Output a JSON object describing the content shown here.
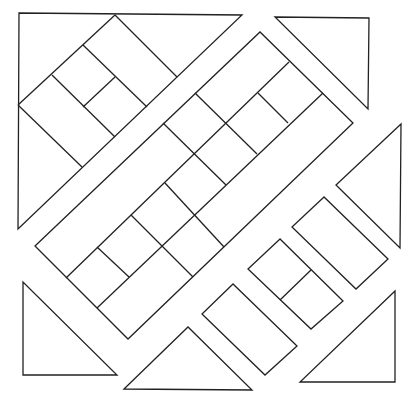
{
  "diagram": {
    "title": "Quilt block line drawing",
    "stroke_color": "#222222",
    "background_color": "#ffffff",
    "pieces": [
      {
        "name": "top-left-triangle",
        "points": "19,13 242,15 18,229"
      },
      {
        "name": "top-right-triangle",
        "points": "275,17 369,18 368,109"
      },
      {
        "name": "right-triangle",
        "points": "401,124 336,185 400,248"
      },
      {
        "name": "bottom-right-triangle",
        "points": "395,291 300,382 395,382"
      },
      {
        "name": "bottom-center-triangle",
        "points": "124,389 188,327 252,390"
      },
      {
        "name": "bottom-left-triangle",
        "points": "23,282 23,375 117,375"
      },
      {
        "name": "center-band",
        "points": "35,246 260,32 353,123 128,339"
      },
      {
        "name": "right-rectangle",
        "points": "324,197 292,227 356,289 388,259"
      },
      {
        "name": "middle-rectangle",
        "points": "280,239 248,269 311,329 343,301"
      },
      {
        "name": "lower-rectangle",
        "points": "233,284 202,314 265,375 297,346"
      }
    ],
    "segments": [
      {
        "name": "tl-rect-edge-1",
        "x1": 115,
        "y1": 15,
        "x2": 177,
        "y2": 77
      },
      {
        "name": "tl-rect-edge-2",
        "x1": 115,
        "y1": 15,
        "x2": 18,
        "y2": 105
      },
      {
        "name": "tl-rect-edge-3",
        "x1": 83,
        "y1": 45,
        "x2": 147,
        "y2": 107
      },
      {
        "name": "tl-rect-edge-4",
        "x1": 52,
        "y1": 75,
        "x2": 115,
        "y2": 137
      },
      {
        "name": "tl-rect-edge-5",
        "x1": 18,
        "y1": 105,
        "x2": 82,
        "y2": 167
      },
      {
        "name": "tl-rect-divider",
        "x1": 115,
        "y1": 77,
        "x2": 83,
        "y2": 107
      },
      {
        "name": "band-long-line-b",
        "x1": 66,
        "y1": 278,
        "x2": 289,
        "y2": 62
      },
      {
        "name": "band-long-line-c",
        "x1": 97,
        "y1": 308,
        "x2": 323,
        "y2": 93
      },
      {
        "name": "band-cross-1",
        "x1": 195,
        "y1": 93,
        "x2": 257,
        "y2": 154
      },
      {
        "name": "band-cross-2",
        "x1": 258,
        "y1": 93,
        "x2": 288,
        "y2": 123
      },
      {
        "name": "band-cross-3",
        "x1": 163,
        "y1": 123,
        "x2": 226,
        "y2": 185
      },
      {
        "name": "band-cross-4",
        "x1": 165,
        "y1": 183,
        "x2": 224,
        "y2": 247
      },
      {
        "name": "band-cross-5",
        "x1": 131,
        "y1": 215,
        "x2": 193,
        "y2": 277
      },
      {
        "name": "band-cross-6",
        "x1": 97,
        "y1": 247,
        "x2": 129,
        "y2": 277
      },
      {
        "name": "middle-rect-divider",
        "x1": 311,
        "y1": 270,
        "x2": 280,
        "y2": 300
      }
    ]
  }
}
